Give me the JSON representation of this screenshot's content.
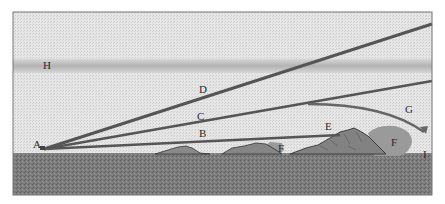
{
  "diagram": {
    "labels": {
      "A": "A",
      "B": "B",
      "C": "C",
      "D": "D",
      "E": "E",
      "F1": "F",
      "F2": "F",
      "G": "G",
      "H": "H",
      "I": "I"
    },
    "colors": {
      "sky": "#e4e4e4",
      "ground": "#7a7a7a",
      "band": "#bdbdbd",
      "ray": "#555555",
      "mountain": "#8a8a8a",
      "shadow": "#9c9c9c",
      "border": "#777777"
    }
  }
}
